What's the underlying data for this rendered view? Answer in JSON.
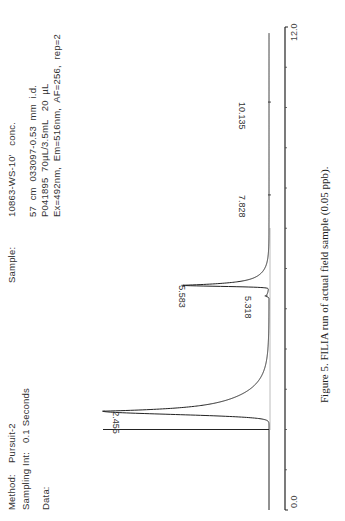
{
  "header": {
    "method_label": "Method:",
    "method_value": "Pursuit-2",
    "sampling_label": "Sampling Int:",
    "sampling_value": "0.1 Seconds",
    "data_label": "Data:",
    "sample_label": "Sample:",
    "sample_value": "10863-WS-10'   conc.",
    "info_line1": "57  cm  033097-0.53  mm  i.d.",
    "info_line2": "P041895  70µL/3.5mL   20  µL",
    "info_line3": "Ex=492nm,  Em=516nm,  AF=256,  rep=2"
  },
  "caption": "Figure 5. FILIA run of actual field sample (0.05 ppb).",
  "chart_data": {
    "type": "line",
    "title": "",
    "xlabel": "Retention time (min)",
    "ylabel": "Fluorescence response",
    "xlim": [
      0.0,
      12.0
    ],
    "x_tick_labels": [
      "0.0",
      "12.0"
    ],
    "x_ticks": [
      0,
      1,
      2,
      3,
      4,
      5,
      6,
      7,
      8,
      9,
      10,
      11,
      12
    ],
    "grid": false,
    "injection_marker_time": 2.0,
    "peaks": [
      {
        "label": "2.455",
        "time": 2.455,
        "relative_height": 1.0
      },
      {
        "label": "5.318",
        "time": 5.318,
        "relative_height": 0.02
      },
      {
        "label": "5.583",
        "time": 5.583,
        "relative_height": 0.52
      },
      {
        "label": "7.828",
        "time": 7.828,
        "relative_height": 0.0
      },
      {
        "label": "10.135",
        "time": 10.135,
        "relative_height": 0.0
      }
    ]
  }
}
